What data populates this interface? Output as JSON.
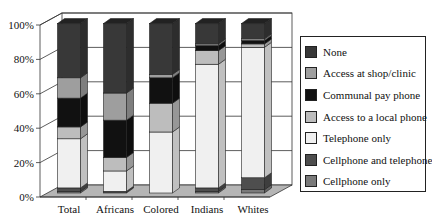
{
  "chart_data": {
    "type": "bar",
    "stacked": true,
    "percent": true,
    "three_d": true,
    "title": "",
    "xlabel": "",
    "ylabel": "",
    "ylim": [
      0,
      100
    ],
    "y_ticks": [
      "0%",
      "20%",
      "40%",
      "60%",
      "80%",
      "100%"
    ],
    "grid": true,
    "legend_position": "right",
    "categories": [
      "Total",
      "Africans",
      "Colored",
      "Indians",
      "Whites"
    ],
    "series": [
      {
        "name": "Cellphone only",
        "color": "#7a7a7a",
        "values": [
          1,
          0,
          0,
          1,
          2
        ]
      },
      {
        "name": "Cellphone and telephone",
        "color": "#4e4e4e",
        "values": [
          2,
          1,
          0,
          2,
          7
        ]
      },
      {
        "name": "Telephone only",
        "color": "#f0f0f0",
        "values": [
          29,
          12,
          36,
          73,
          77
        ]
      },
      {
        "name": "Access to a local phone",
        "color": "#bdbdbd",
        "values": [
          7,
          8,
          17,
          8,
          2
        ]
      },
      {
        "name": "Communal pay phone",
        "color": "#111111",
        "values": [
          17,
          22,
          15,
          3,
          2
        ]
      },
      {
        "name": "Access at shop/clinic",
        "color": "#9e9e9e",
        "values": [
          12,
          16,
          2,
          1,
          1
        ]
      },
      {
        "name": "None",
        "color": "#383838",
        "values": [
          32,
          41,
          30,
          12,
          9
        ]
      }
    ]
  },
  "legend": {
    "items": [
      {
        "label": "None",
        "color": "#383838"
      },
      {
        "label": "Access at shop/clinic",
        "color": "#9e9e9e"
      },
      {
        "label": "Communal pay phone",
        "color": "#111111"
      },
      {
        "label": "Access to a local phone",
        "color": "#bdbdbd"
      },
      {
        "label": "Telephone only",
        "color": "#f0f0f0"
      },
      {
        "label": "Cellphone and telephone",
        "color": "#4e4e4e"
      },
      {
        "label": "Cellphone only",
        "color": "#7a7a7a"
      }
    ]
  }
}
